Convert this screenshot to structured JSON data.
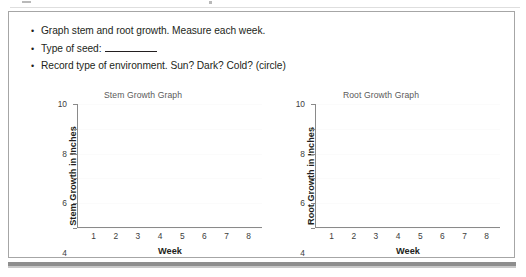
{
  "worksheet": {
    "instructions": [
      {
        "bullet": "•",
        "text": "Graph stem and root growth. Measure each week.",
        "blank": false
      },
      {
        "bullet": "•",
        "text": "Type of seed:",
        "blank": true
      },
      {
        "bullet": "•",
        "text": "Record type of environment. Sun? Dark? Cold? (circle)",
        "blank": false
      }
    ]
  },
  "chart_data": [
    {
      "type": "line",
      "title": "Stem Growth Graph",
      "xlabel": "Week",
      "ylabel": "Stem Growth in Inches",
      "categories": [
        1,
        2,
        3,
        4,
        5,
        6,
        7,
        8
      ],
      "xticklabels": [
        "1",
        "2",
        "3",
        "4",
        "5",
        "6",
        "7",
        "8"
      ],
      "yticks": [
        0,
        2,
        4,
        6,
        8,
        10
      ],
      "yticklabels": [
        "0",
        "2",
        "4",
        "6",
        "8",
        "10"
      ],
      "ylim": [
        0,
        10
      ],
      "xlim": [
        0,
        8
      ],
      "values": [],
      "grid": false,
      "legend": false,
      "axis_color": "#8a8a8a",
      "text_color": "#231f20"
    },
    {
      "type": "line",
      "title": "Root Growth Graph",
      "xlabel": "Week",
      "ylabel": "Root Growth in Inches",
      "categories": [
        1,
        2,
        3,
        4,
        5,
        6,
        7,
        8
      ],
      "xticklabels": [
        "1",
        "2",
        "3",
        "4",
        "5",
        "6",
        "7",
        "8"
      ],
      "yticks": [
        0,
        2,
        4,
        6,
        8,
        10
      ],
      "yticklabels": [
        "0",
        "2",
        "4",
        "6",
        "8",
        "10"
      ],
      "ylim": [
        0,
        10
      ],
      "xlim": [
        0,
        8
      ],
      "values": [],
      "grid": false,
      "legend": false,
      "axis_color": "#8a8a8a",
      "text_color": "#231f20"
    }
  ]
}
